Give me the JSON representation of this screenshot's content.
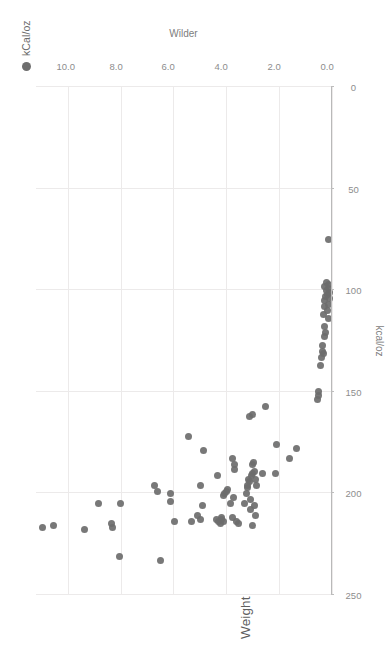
{
  "chart_data": {
    "type": "scatter",
    "title": "Weight Efficiency (kCal/oz) vs. Wilder Ratio",
    "xlabel": "kcal/oz",
    "ylabel": "Wilder",
    "legend": [
      {
        "name": "kCal/oz",
        "color": "#6d6d6d"
      }
    ],
    "legend_position": "top-right",
    "grid": true,
    "point_color": "#6d6d6d",
    "axis_color": "#b9b9b9",
    "grid_color": "#eceaea",
    "xlim": [
      0,
      250
    ],
    "ylim": [
      0,
      11.2
    ],
    "x_reversed": true,
    "xticks": [
      250,
      200,
      150,
      100,
      50,
      0
    ],
    "xticklabels": [
      "250",
      "200",
      "150",
      "100",
      "50",
      "0"
    ],
    "yticks": [
      0.0,
      2.0,
      4.0,
      6.0,
      8.0,
      10.0
    ],
    "yticklabels": [
      "0.0",
      "2.0",
      "4.0",
      "6.0",
      "8.0",
      "10.0"
    ],
    "points": [
      {
        "x": 217,
        "y": 10.95
      },
      {
        "x": 216,
        "y": 10.55
      },
      {
        "x": 218,
        "y": 9.35
      },
      {
        "x": 205,
        "y": 8.85
      },
      {
        "x": 215,
        "y": 8.35
      },
      {
        "x": 217,
        "y": 8.3
      },
      {
        "x": 231,
        "y": 8.05
      },
      {
        "x": 205,
        "y": 8.0
      },
      {
        "x": 196,
        "y": 6.72
      },
      {
        "x": 199,
        "y": 6.6
      },
      {
        "x": 233,
        "y": 6.5
      },
      {
        "x": 204,
        "y": 6.12
      },
      {
        "x": 200,
        "y": 6.1
      },
      {
        "x": 214,
        "y": 5.95
      },
      {
        "x": 172,
        "y": 5.42
      },
      {
        "x": 214,
        "y": 5.3
      },
      {
        "x": 211,
        "y": 5.1
      },
      {
        "x": 213,
        "y": 4.98
      },
      {
        "x": 196,
        "y": 4.98
      },
      {
        "x": 206,
        "y": 4.9
      },
      {
        "x": 179,
        "y": 4.88
      },
      {
        "x": 213,
        "y": 4.38
      },
      {
        "x": 191,
        "y": 4.35
      },
      {
        "x": 214,
        "y": 4.28
      },
      {
        "x": 215,
        "y": 4.22
      },
      {
        "x": 213,
        "y": 4.2
      },
      {
        "x": 212,
        "y": 4.18
      },
      {
        "x": 214,
        "y": 4.12
      },
      {
        "x": 201,
        "y": 4.1
      },
      {
        "x": 200,
        "y": 4.05
      },
      {
        "x": 199,
        "y": 4.0
      },
      {
        "x": 198,
        "y": 3.95
      },
      {
        "x": 205,
        "y": 3.85
      },
      {
        "x": 212,
        "y": 3.78
      },
      {
        "x": 183,
        "y": 3.75
      },
      {
        "x": 202,
        "y": 3.72
      },
      {
        "x": 186,
        "y": 3.7
      },
      {
        "x": 188,
        "y": 3.68
      },
      {
        "x": 214,
        "y": 3.6
      },
      {
        "x": 215,
        "y": 3.55
      },
      {
        "x": 205,
        "y": 3.3
      },
      {
        "x": 200,
        "y": 3.22
      },
      {
        "x": 197,
        "y": 3.2
      },
      {
        "x": 196,
        "y": 3.18
      },
      {
        "x": 193,
        "y": 3.15
      },
      {
        "x": 194,
        "y": 3.12
      },
      {
        "x": 203,
        "y": 3.1
      },
      {
        "x": 208,
        "y": 3.08
      },
      {
        "x": 191,
        "y": 3.05
      },
      {
        "x": 190,
        "y": 3.02
      },
      {
        "x": 216,
        "y": 3.0
      },
      {
        "x": 186,
        "y": 3.0
      },
      {
        "x": 185,
        "y": 2.98
      },
      {
        "x": 162,
        "y": 3.12
      },
      {
        "x": 161,
        "y": 3.0
      },
      {
        "x": 206,
        "y": 2.95
      },
      {
        "x": 189,
        "y": 2.93
      },
      {
        "x": 193,
        "y": 2.9
      },
      {
        "x": 211,
        "y": 2.88
      },
      {
        "x": 196,
        "y": 2.85
      },
      {
        "x": 190,
        "y": 2.62
      },
      {
        "x": 157,
        "y": 2.5
      },
      {
        "x": 190,
        "y": 2.13
      },
      {
        "x": 176,
        "y": 2.1
      },
      {
        "x": 183,
        "y": 1.62
      },
      {
        "x": 178,
        "y": 1.35
      },
      {
        "x": 154,
        "y": 0.55
      },
      {
        "x": 152,
        "y": 0.52
      },
      {
        "x": 150,
        "y": 0.5
      },
      {
        "x": 137,
        "y": 0.42
      },
      {
        "x": 133,
        "y": 0.38
      },
      {
        "x": 130,
        "y": 0.37
      },
      {
        "x": 127,
        "y": 0.35
      },
      {
        "x": 131,
        "y": 0.33
      },
      {
        "x": 123,
        "y": 0.3
      },
      {
        "x": 118,
        "y": 0.28
      },
      {
        "x": 121,
        "y": 0.25
      },
      {
        "x": 112,
        "y": 0.33
      },
      {
        "x": 108,
        "y": 0.3
      },
      {
        "x": 105,
        "y": 0.27
      },
      {
        "x": 103,
        "y": 0.25
      },
      {
        "x": 100,
        "y": 0.22
      },
      {
        "x": 102,
        "y": 0.18
      },
      {
        "x": 99,
        "y": 0.15
      },
      {
        "x": 97,
        "y": 0.13
      },
      {
        "x": 101,
        "y": 0.1
      },
      {
        "x": 104,
        "y": 0.08
      },
      {
        "x": 107,
        "y": 0.12
      },
      {
        "x": 96,
        "y": 0.2
      },
      {
        "x": 98,
        "y": 0.3
      },
      {
        "x": 110,
        "y": 0.18
      },
      {
        "x": 114,
        "y": 0.12
      },
      {
        "x": 75,
        "y": 0.12
      }
    ]
  }
}
